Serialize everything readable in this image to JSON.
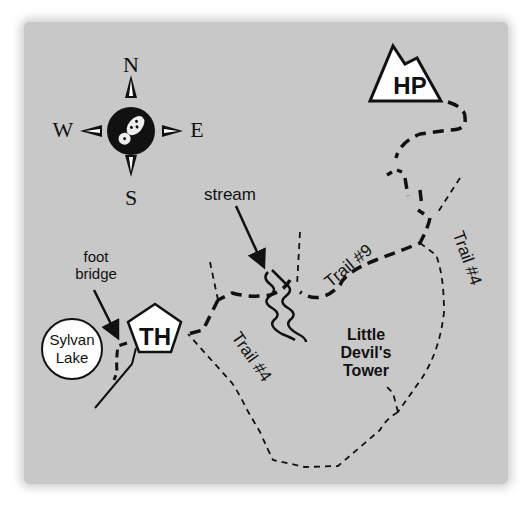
{
  "map": {
    "compass": {
      "north": "N",
      "south": "S",
      "east": "E",
      "west": "W",
      "center_icon": "footprint-icon"
    },
    "landmarks": {
      "high_point": "HP",
      "trailhead": "TH",
      "lake_line1": "Sylvan",
      "lake_line2": "Lake",
      "tower_line1": "Little",
      "tower_line2": "Devil's",
      "tower_line3": "Tower"
    },
    "annotations": {
      "stream": "stream",
      "foot_bridge_line1": "foot",
      "foot_bridge_line2": "bridge"
    },
    "trails": {
      "trail_9": "Trail #9",
      "trail_4_west": "Trail #4",
      "trail_4_east": "Trail #4"
    },
    "colors": {
      "background": "#c8c8c8",
      "ink": "#111111",
      "symbol_fill": "#ffffff"
    }
  }
}
